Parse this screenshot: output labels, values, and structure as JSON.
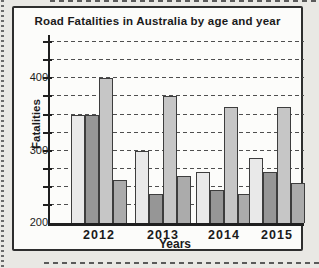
{
  "chart_data": {
    "type": "bar",
    "title": "Road Fatalities in Australia by age and year",
    "xlabel": "Years",
    "ylabel": "Fatalities",
    "categories": [
      "2012",
      "2013",
      "2014",
      "2015"
    ],
    "series": [
      {
        "name": "bar-1-lightest-gray",
        "color": "#e9e9e9",
        "values": [
          350,
          300,
          270,
          290
        ]
      },
      {
        "name": "bar-2-dark-gray",
        "color": "#969696",
        "values": [
          350,
          240,
          245,
          270
        ]
      },
      {
        "name": "bar-3-light-gray",
        "color": "#c6c6c6",
        "values": [
          400,
          375,
          360,
          360
        ]
      },
      {
        "name": "bar-4-medium-gray",
        "color": "#ababab",
        "values": [
          260,
          265,
          240,
          255
        ]
      }
    ],
    "ylim": [
      200,
      460
    ],
    "grid": true,
    "grid_step": 25,
    "ytick_labels": [
      400,
      300,
      200
    ],
    "legend": false,
    "colors": {
      "axis": "#1f1f1f",
      "grid": "#4f4f4f",
      "bar_border": "#3d3d3d",
      "card_border": "#2e2e2e",
      "card_background": "#fcfcfa",
      "page_background": "#e9e8e4"
    }
  }
}
